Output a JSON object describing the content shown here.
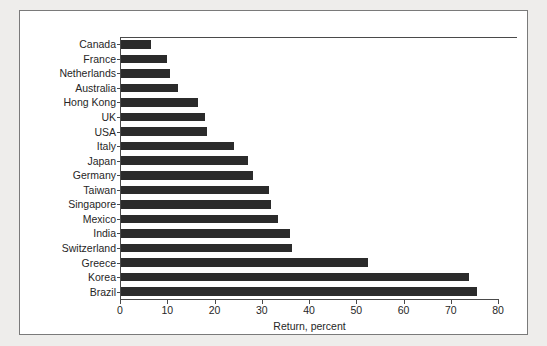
{
  "chart_data": {
    "type": "bar",
    "orientation": "horizontal",
    "title": "",
    "xlabel": "Return, percent",
    "ylabel": "",
    "xlim": [
      0,
      80
    ],
    "xticks": [
      0,
      10,
      20,
      30,
      40,
      50,
      60,
      70,
      80
    ],
    "grid": false,
    "legend": false,
    "bar_color": "#2b2b2b",
    "categories": [
      "Canada",
      "France",
      "Netherlands",
      "Australia",
      "Hong Kong",
      "UK",
      "USA",
      "Italy",
      "Japan",
      "Germany",
      "Taiwan",
      "Singapore",
      "Mexico",
      "India",
      "Switzerland",
      "Greece",
      "Korea",
      "Brazil"
    ],
    "values": [
      6.3,
      9.7,
      10.3,
      12.0,
      16.3,
      17.7,
      18.3,
      24.0,
      26.8,
      28.0,
      31.4,
      31.8,
      33.3,
      35.7,
      36.1,
      52.3,
      73.7,
      75.3
    ]
  },
  "figure": {
    "background_color": "#eeedeb",
    "panel_color": "#ffffff",
    "border_color": "#7a7a7a"
  }
}
